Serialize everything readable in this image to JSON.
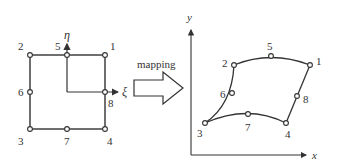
{
  "left_element": {
    "nodes": [
      {
        "id": "1",
        "label": "1",
        "x": 105,
        "y": 55
      },
      {
        "id": "2",
        "label": "2",
        "x": 30,
        "y": 55
      },
      {
        "id": "3",
        "label": "3",
        "x": 30,
        "y": 129
      },
      {
        "id": "4",
        "label": "4",
        "x": 105,
        "y": 129
      },
      {
        "id": "5",
        "label": "5",
        "x": 67,
        "y": 55
      },
      {
        "id": "6",
        "label": "6",
        "x": 30,
        "y": 92
      },
      {
        "id": "7",
        "label": "7",
        "x": 67,
        "y": 129
      },
      {
        "id": "8",
        "label": "8",
        "x": 105,
        "y": 92
      }
    ],
    "axis_eta": "η",
    "axis_xi": "ξ"
  },
  "arrow": {
    "label": "mapping"
  },
  "right_element": {
    "nodes": [
      {
        "id": "1",
        "label": "1"
      },
      {
        "id": "2",
        "label": "2"
      },
      {
        "id": "3",
        "label": "3"
      },
      {
        "id": "4",
        "label": "4"
      },
      {
        "id": "5",
        "label": "5"
      },
      {
        "id": "6",
        "label": "6"
      },
      {
        "id": "7",
        "label": "7"
      },
      {
        "id": "8",
        "label": "8"
      }
    ],
    "axis_x": "x",
    "axis_y": "y"
  },
  "colors": {
    "stroke": "#333333",
    "background": "#ffffff"
  }
}
